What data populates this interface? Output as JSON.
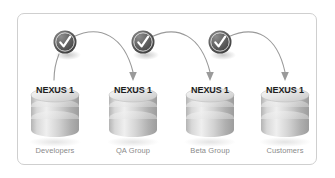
{
  "diagram": {
    "frame": {
      "border_color": "#cfcfcf",
      "background": "#ffffff"
    },
    "palette": {
      "badge_dark": "#555555",
      "badge_mid": "#6e6e6e",
      "badge_light": "#8f8f8f",
      "check_color": "#ffffff",
      "arrow_color": "#9a9a9a",
      "cylinder_light": "#efefef",
      "cylinder_mid": "#c9c9c9",
      "cylinder_dark": "#a3a3a3",
      "label_color": "#8a8a8a",
      "nexus_text_color": "#1d1d1d"
    },
    "nodes": [
      {
        "id": "developers",
        "nexus": "NEXUS 1",
        "label": "Developers",
        "cx": 55
      },
      {
        "id": "qa-group",
        "nexus": "NEXUS 1",
        "label": "QA Group",
        "cx": 133
      },
      {
        "id": "beta-group",
        "nexus": "NEXUS 1",
        "label": "Beta Group",
        "cx": 210
      },
      {
        "id": "customers",
        "nexus": "NEXUS 1",
        "label": "Customers",
        "cx": 285
      }
    ],
    "badges": [
      {
        "id": "badge-1",
        "icon": "check-icon",
        "cx": 65,
        "cy": 42
      },
      {
        "id": "badge-2",
        "icon": "check-icon",
        "cx": 143,
        "cy": 42
      },
      {
        "id": "badge-3",
        "icon": "check-icon",
        "cx": 220,
        "cy": 42
      }
    ],
    "connectors": [
      {
        "id": "connector-developers-to-qa",
        "from": "developers",
        "to": "qa-group",
        "arrowhead": true
      },
      {
        "id": "connector-qa-to-beta",
        "from": "qa-group",
        "to": "beta-group",
        "arrowhead": true
      },
      {
        "id": "connector-beta-to-customers",
        "from": "beta-group",
        "to": "customers",
        "arrowhead": true
      }
    ]
  }
}
